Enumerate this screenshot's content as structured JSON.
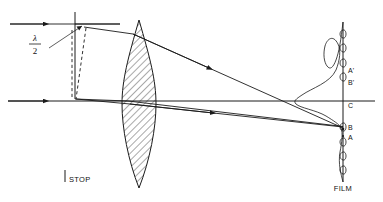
{
  "figure": {
    "width": 383,
    "height": 202,
    "background": "#ffffff",
    "ink": "#1a1a1a"
  },
  "labels": {
    "lambda_symbol": "λ",
    "lambda_denominator": "2",
    "stop": "STOP",
    "film": "FILM",
    "point_a_prime": "A'",
    "point_b_prime": "B'",
    "point_c": "C",
    "point_b": "B",
    "point_a": "A"
  },
  "components": {
    "lens": {
      "name": "biconvex-lens",
      "center_x": 139,
      "top_y": 20,
      "bottom_y": 188,
      "half_width": 17,
      "hatch": "diagonal"
    },
    "stop": {
      "name": "aperture-stop",
      "x": 75,
      "top_y": 12,
      "bottom_y": 99
    },
    "film": {
      "name": "film-plane",
      "x": 343,
      "top_y": 22,
      "bottom_y": 182
    },
    "optical_axis": {
      "y": 101,
      "x_start": 8,
      "x_end": 375
    }
  },
  "rays": {
    "incoming_upper": {
      "y": 24,
      "x_start": 10,
      "x_end": 120
    },
    "incoming_axial": {
      "y": 101,
      "x_start": 8,
      "x_end": 120
    },
    "converging_upper_target": "B",
    "converging_lower_target": "B",
    "crossing_x": 277
  },
  "wavefront": {
    "vertical_dash_x": 72,
    "tilted_dash_top_x": 86,
    "tilted_dash_bottom_x": 76,
    "path_difference": "λ/2"
  },
  "intensity_curve": {
    "name": "point-spread-function",
    "main_peak_at": "B",
    "secondary_peak_at": "B'",
    "baseline_x": 343
  },
  "film_grain": {
    "bead_count": 9,
    "description": "emulsion grain beads along film plane"
  }
}
